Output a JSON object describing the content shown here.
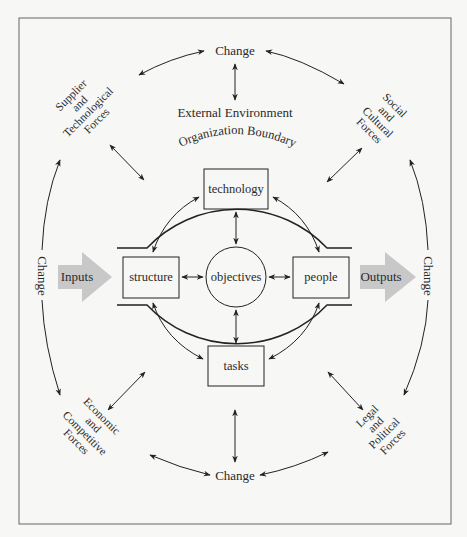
{
  "diagram": {
    "external_environment_label": "External Environment",
    "organization_boundary_label": "Organization Boundary",
    "change_labels": {
      "top": "Change",
      "bottom": "Change",
      "left": "Change",
      "right": "Change"
    },
    "forces": {
      "top_left": [
        "Supplier",
        "and",
        "Technological",
        "Forces"
      ],
      "top_right": [
        "Social",
        "and",
        "Cultural",
        "Forces"
      ],
      "bottom_left": [
        "Economic",
        "and",
        "Competitive",
        "Forces"
      ],
      "bottom_right": [
        "Legal",
        "and",
        "Political",
        "Forces"
      ]
    },
    "internal_components": {
      "top": "technology",
      "left": "structure",
      "right": "people",
      "bottom": "tasks",
      "center": "objectives"
    },
    "flows": {
      "input": "Inputs",
      "output": "Outputs"
    },
    "colors": {
      "background": "#f7f7f6",
      "line": "#222222",
      "frame": "#666666",
      "flow_arrow": "#c8c8c8"
    }
  }
}
